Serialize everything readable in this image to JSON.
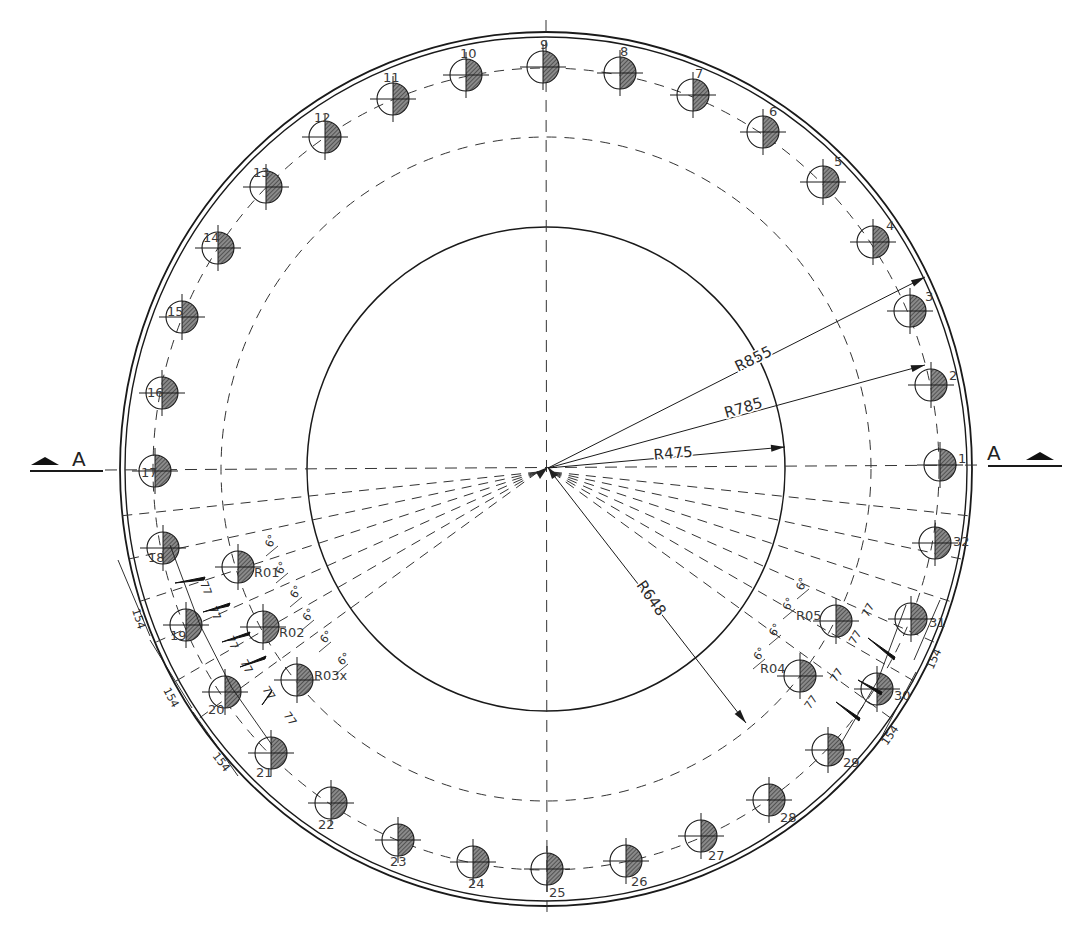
{
  "drawing": {
    "center": {
      "x": 546,
      "y": 469
    },
    "stroke_color": "#1a1a1a",
    "hatch_color": "#555555",
    "circles": {
      "outer_rim_1": {
        "rx": 426,
        "ry": 437
      },
      "outer_rim_2": {
        "rx": 421,
        "ry": 432
      },
      "bolt_circle_dashed": {
        "rx": 393,
        "ry": 401
      },
      "inner_dashed": {
        "rx": 325,
        "ry": 332
      },
      "inner_solid": {
        "rx": 239,
        "ry": 242
      }
    },
    "bolt_radius": 16,
    "bolts": [
      {
        "n": "1",
        "x": 940,
        "y": 465,
        "lx": 958,
        "ly": 463
      },
      {
        "n": "2",
        "x": 931,
        "y": 385,
        "lx": 949,
        "ly": 380
      },
      {
        "n": "3",
        "x": 910,
        "y": 311,
        "lx": 925,
        "ly": 301
      },
      {
        "n": "4",
        "x": 873,
        "y": 242,
        "lx": 886,
        "ly": 230
      },
      {
        "n": "5",
        "x": 823,
        "y": 182,
        "lx": 834,
        "ly": 166
      },
      {
        "n": "6",
        "x": 763,
        "y": 132,
        "lx": 769,
        "ly": 116
      },
      {
        "n": "7",
        "x": 693,
        "y": 95,
        "lx": 695,
        "ly": 78
      },
      {
        "n": "8",
        "x": 620,
        "y": 73,
        "lx": 620,
        "ly": 56
      },
      {
        "n": "9",
        "x": 543,
        "y": 67,
        "lx": 540,
        "ly": 49
      },
      {
        "n": "10",
        "x": 466,
        "y": 75,
        "lx": 460,
        "ly": 58
      },
      {
        "n": "11",
        "x": 393,
        "y": 99,
        "lx": 383,
        "ly": 82
      },
      {
        "n": "12",
        "x": 325,
        "y": 137,
        "lx": 314,
        "ly": 122
      },
      {
        "n": "13",
        "x": 266,
        "y": 187,
        "lx": 253,
        "ly": 177
      },
      {
        "n": "14",
        "x": 218,
        "y": 248,
        "lx": 203,
        "ly": 242
      },
      {
        "n": "15",
        "x": 182,
        "y": 317,
        "lx": 167,
        "ly": 316
      },
      {
        "n": "16",
        "x": 162,
        "y": 393,
        "lx": 147,
        "ly": 397
      },
      {
        "n": "17",
        "x": 155,
        "y": 471,
        "lx": 141,
        "ly": 477
      },
      {
        "n": "18",
        "x": 163,
        "y": 548,
        "lx": 148,
        "ly": 562
      },
      {
        "n": "19",
        "x": 186,
        "y": 625,
        "lx": 170,
        "ly": 640
      },
      {
        "n": "20",
        "x": 225,
        "y": 692,
        "lx": 208,
        "ly": 714
      },
      {
        "n": "21",
        "x": 271,
        "y": 753,
        "lx": 256,
        "ly": 777
      },
      {
        "n": "22",
        "x": 331,
        "y": 803,
        "lx": 318,
        "ly": 829
      },
      {
        "n": "23",
        "x": 398,
        "y": 840,
        "lx": 390,
        "ly": 866
      },
      {
        "n": "24",
        "x": 473,
        "y": 862,
        "lx": 468,
        "ly": 888
      },
      {
        "n": "25",
        "x": 547,
        "y": 869,
        "lx": 549,
        "ly": 897
      },
      {
        "n": "26",
        "x": 626,
        "y": 861,
        "lx": 631,
        "ly": 886
      },
      {
        "n": "27",
        "x": 701,
        "y": 836,
        "lx": 708,
        "ly": 860
      },
      {
        "n": "28",
        "x": 769,
        "y": 800,
        "lx": 780,
        "ly": 822
      },
      {
        "n": "29",
        "x": 828,
        "y": 750,
        "lx": 843,
        "ly": 767
      },
      {
        "n": "30",
        "x": 877,
        "y": 689,
        "lx": 894,
        "ly": 700
      },
      {
        "n": "31",
        "x": 911,
        "y": 619,
        "lx": 929,
        "ly": 627
      },
      {
        "n": "32",
        "x": 935,
        "y": 543,
        "lx": 953,
        "ly": 546
      }
    ],
    "inner_bolts": [
      {
        "n": "R01",
        "x": 238,
        "y": 567,
        "lx": 254,
        "ly": 577
      },
      {
        "n": "R02",
        "x": 263,
        "y": 627,
        "lx": 279,
        "ly": 637
      },
      {
        "n": "R03x",
        "x": 297,
        "y": 680,
        "lx": 314,
        "ly": 680
      },
      {
        "n": "R04",
        "x": 800,
        "y": 676,
        "lx": 760,
        "ly": 673
      },
      {
        "n": "R05",
        "x": 836,
        "y": 621,
        "lx": 796,
        "ly": 620
      }
    ],
    "radius_dims": [
      {
        "label": "R855",
        "x2": 925,
        "y2": 277,
        "tx": 738,
        "ty": 372,
        "rot": -26
      },
      {
        "label": "R785",
        "x2": 925,
        "y2": 365,
        "tx": 726,
        "ty": 418,
        "rot": -16
      },
      {
        "label": "R475",
        "x2": 785,
        "y2": 447,
        "tx": 654,
        "ty": 460,
        "rot": -5
      },
      {
        "label": "R648",
        "x2": 746,
        "y2": 723,
        "tx": 636,
        "ty": 585,
        "rot": 55
      }
    ],
    "angle_labels": [
      {
        "label": "6°",
        "x": 272,
        "y": 548,
        "rot": -70
      },
      {
        "label": "6°",
        "x": 282,
        "y": 575,
        "rot": -65
      },
      {
        "label": "6°",
        "x": 296,
        "y": 599,
        "rot": -60
      },
      {
        "label": "6°",
        "x": 308,
        "y": 622,
        "rot": -55
      },
      {
        "label": "6°",
        "x": 325,
        "y": 644,
        "rot": -50
      },
      {
        "label": "6°",
        "x": 342,
        "y": 666,
        "rot": -45
      },
      {
        "label": "6°",
        "x": 803,
        "y": 591,
        "rot": -70
      },
      {
        "label": "6°",
        "x": 789,
        "y": 611,
        "rot": -65
      },
      {
        "label": "6°",
        "x": 775,
        "y": 637,
        "rot": -60
      },
      {
        "label": "6°",
        "x": 759,
        "y": 661,
        "rot": -55
      }
    ],
    "linear_dims": [
      {
        "label": "77",
        "x": 200,
        "y": 583,
        "rot": 70
      },
      {
        "label": "77",
        "x": 209,
        "y": 608,
        "rot": 68
      },
      {
        "label": "77",
        "x": 226,
        "y": 638,
        "rot": 65
      },
      {
        "label": "77",
        "x": 240,
        "y": 662,
        "rot": 62
      },
      {
        "label": "77",
        "x": 262,
        "y": 689,
        "rot": 58
      },
      {
        "label": "77",
        "x": 283,
        "y": 715,
        "rot": 55
      },
      {
        "label": "77",
        "x": 868,
        "y": 618,
        "rot": -62
      },
      {
        "label": "77",
        "x": 855,
        "y": 645,
        "rot": -60
      },
      {
        "label": "77",
        "x": 836,
        "y": 683,
        "rot": -58
      },
      {
        "label": "77",
        "x": 810,
        "y": 710,
        "rot": -55
      },
      {
        "label": "154",
        "x": 132,
        "y": 610,
        "rot": 72
      },
      {
        "label": "154",
        "x": 163,
        "y": 690,
        "rot": 62
      },
      {
        "label": "154",
        "x": 212,
        "y": 756,
        "rot": 52
      },
      {
        "label": "154",
        "x": 933,
        "y": 670,
        "rot": -66
      },
      {
        "label": "154",
        "x": 887,
        "y": 746,
        "rot": -55
      }
    ],
    "section_markers": [
      {
        "label": "A",
        "side": "left",
        "lx": 72,
        "ly": 466,
        "line_x1": 30,
        "line_x2": 103,
        "tri_x": 45
      },
      {
        "label": "A",
        "side": "right",
        "lx": 987,
        "ly": 460,
        "line_x1": 988,
        "line_x2": 1062,
        "tri_x": 1040
      }
    ],
    "dashed_rays_left": [
      186,
      192,
      198,
      204,
      210,
      216
    ],
    "dashed_rays_right": [
      -6,
      -12,
      -18,
      -24,
      -30,
      -36
    ]
  }
}
